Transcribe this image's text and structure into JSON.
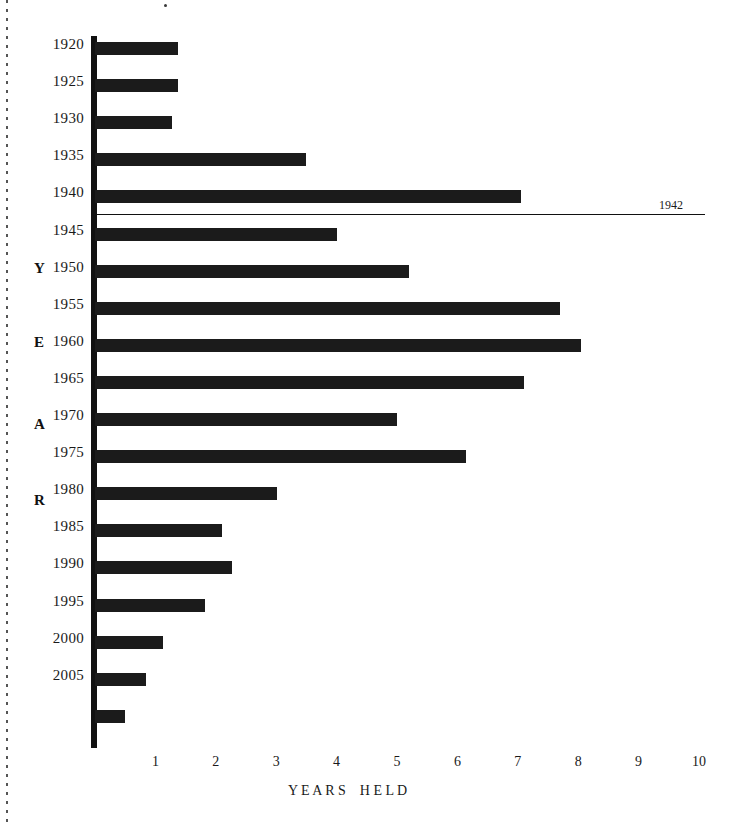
{
  "chart_data": {
    "type": "bar",
    "orientation": "horizontal",
    "title": "",
    "xlabel": "Y E A R S    H E L D",
    "ylabel": "Y E A R",
    "xlim": [
      0,
      10
    ],
    "ylim_labels": [
      "1920",
      "2005"
    ],
    "grid": false,
    "legend": null,
    "x_ticks": [
      "1",
      "2",
      "3",
      "4",
      "5",
      "6",
      "7",
      "8",
      "9",
      "10"
    ],
    "y_tick_labels": [
      "1920",
      "1925",
      "1930",
      "1935",
      "1940",
      "1945",
      "1950",
      "1955",
      "1960",
      "1965",
      "1970",
      "1975",
      "1980",
      "1985",
      "1990",
      "1995",
      "2000",
      "2005"
    ],
    "y_axis_letters": [
      "Y",
      "E",
      "A",
      "R"
    ],
    "categories": [
      "1920",
      "1925",
      "1930",
      "1935",
      "1940",
      "1945",
      "1950",
      "1955",
      "1960",
      "1965",
      "1970",
      "1975",
      "1980",
      "1985",
      "1990",
      "1995",
      "2000",
      "2005",
      "2010"
    ],
    "values": [
      1.37,
      1.37,
      1.27,
      3.5,
      7.05,
      4.0,
      5.2,
      7.7,
      8.05,
      7.1,
      5.0,
      6.15,
      3.02,
      2.1,
      2.27,
      1.82,
      1.12,
      0.85,
      0.5
    ],
    "annotations": [
      {
        "label": "1942",
        "value_year": "1942",
        "description": "horizontal reference line drawn across the plot just below the 1940 bar"
      }
    ]
  },
  "axis": {
    "x_title": "Y E A R S    H E L D",
    "y_letters": {
      "y": "Y",
      "e": "E",
      "a": "A",
      "r": "R"
    }
  },
  "annotation": {
    "year_label": "1942"
  },
  "colors": {
    "bar": "#1b1b1b",
    "axis": "#111111",
    "text": "#1a1a1a",
    "background": "#ffffff"
  }
}
